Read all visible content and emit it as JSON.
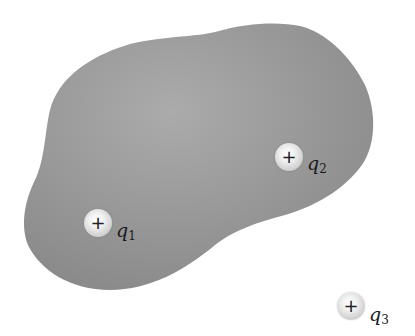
{
  "diagram": {
    "type": "charges-and-conductor",
    "region": {
      "name": "gray-blob-region",
      "fill_center": "#a9a9a9",
      "fill_edge": "#8c8c8c"
    },
    "charges": [
      {
        "id": "q1",
        "symbol": "+",
        "label_var": "q",
        "label_sub": "1",
        "x": 97,
        "y": 223,
        "inside_region": true
      },
      {
        "id": "q2",
        "symbol": "+",
        "label_var": "q",
        "label_sub": "2",
        "x": 288,
        "y": 157,
        "inside_region": true
      },
      {
        "id": "q3",
        "symbol": "+",
        "label_var": "q",
        "label_sub": "3",
        "x": 350,
        "y": 306,
        "inside_region": false
      }
    ]
  }
}
